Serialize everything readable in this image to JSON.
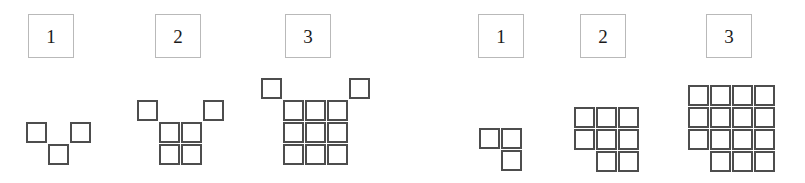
{
  "figure": {
    "title": "",
    "background_color": "#ffffff",
    "square_border_color": "#4d4d4d",
    "label_border_color": "#b9b9b9",
    "label_text_color": "#1a1a1a",
    "canvas": {
      "width": 805,
      "height": 183
    }
  },
  "groups": [
    {
      "id": "left-sequence",
      "figures": [
        {
          "label": "1",
          "label_box": {
            "x": 28,
            "y": 14,
            "w": 46,
            "h": 44
          },
          "square_size": 21,
          "cell": 22,
          "origin": {
            "x": 26,
            "y": 122
          },
          "cells": [
            {
              "col": 0,
              "row": 0
            },
            {
              "col": 2,
              "row": 0
            },
            {
              "col": 1,
              "row": 1
            }
          ],
          "square_count": 3
        },
        {
          "label": "2",
          "label_box": {
            "x": 155,
            "y": 14,
            "w": 46,
            "h": 44
          },
          "square_size": 21,
          "cell": 22,
          "origin": {
            "x": 137,
            "y": 100
          },
          "cells": [
            {
              "col": 0,
              "row": 0
            },
            {
              "col": 3,
              "row": 0
            },
            {
              "col": 1,
              "row": 1
            },
            {
              "col": 2,
              "row": 1
            },
            {
              "col": 1,
              "row": 2
            },
            {
              "col": 2,
              "row": 2
            }
          ],
          "square_count": 6
        },
        {
          "label": "3",
          "label_box": {
            "x": 285,
            "y": 14,
            "w": 46,
            "h": 44
          },
          "square_size": 21,
          "cell": 22,
          "origin": {
            "x": 261,
            "y": 78
          },
          "cells": [
            {
              "col": 0,
              "row": 0
            },
            {
              "col": 4,
              "row": 0
            },
            {
              "col": 1,
              "row": 1
            },
            {
              "col": 2,
              "row": 1
            },
            {
              "col": 3,
              "row": 1
            },
            {
              "col": 1,
              "row": 2
            },
            {
              "col": 2,
              "row": 2
            },
            {
              "col": 3,
              "row": 2
            },
            {
              "col": 1,
              "row": 3
            },
            {
              "col": 2,
              "row": 3
            },
            {
              "col": 3,
              "row": 3
            }
          ],
          "square_count": 11
        }
      ]
    },
    {
      "id": "right-sequence",
      "figures": [
        {
          "label": "1",
          "label_box": {
            "x": 478,
            "y": 14,
            "w": 46,
            "h": 44
          },
          "square_size": 21,
          "cell": 22,
          "origin": {
            "x": 479,
            "y": 128
          },
          "cells": [
            {
              "col": 0,
              "row": 0
            },
            {
              "col": 1,
              "row": 0
            },
            {
              "col": 1,
              "row": 1
            }
          ],
          "square_count": 3
        },
        {
          "label": "2",
          "label_box": {
            "x": 580,
            "y": 14,
            "w": 46,
            "h": 44
          },
          "square_size": 21,
          "cell": 22,
          "origin": {
            "x": 574,
            "y": 107
          },
          "cells": [
            {
              "col": 0,
              "row": 0
            },
            {
              "col": 1,
              "row": 0
            },
            {
              "col": 2,
              "row": 0
            },
            {
              "col": 0,
              "row": 1
            },
            {
              "col": 1,
              "row": 1
            },
            {
              "col": 2,
              "row": 1
            },
            {
              "col": 1,
              "row": 2
            },
            {
              "col": 2,
              "row": 2
            }
          ],
          "square_count": 8
        },
        {
          "label": "3",
          "label_box": {
            "x": 706,
            "y": 14,
            "w": 46,
            "h": 44
          },
          "square_size": 21,
          "cell": 22,
          "origin": {
            "x": 688,
            "y": 85
          },
          "cells": [
            {
              "col": 0,
              "row": 0
            },
            {
              "col": 1,
              "row": 0
            },
            {
              "col": 2,
              "row": 0
            },
            {
              "col": 3,
              "row": 0
            },
            {
              "col": 0,
              "row": 1
            },
            {
              "col": 1,
              "row": 1
            },
            {
              "col": 2,
              "row": 1
            },
            {
              "col": 3,
              "row": 1
            },
            {
              "col": 0,
              "row": 2
            },
            {
              "col": 1,
              "row": 2
            },
            {
              "col": 2,
              "row": 2
            },
            {
              "col": 3,
              "row": 2
            },
            {
              "col": 1,
              "row": 3
            },
            {
              "col": 2,
              "row": 3
            },
            {
              "col": 3,
              "row": 3
            }
          ],
          "square_count": 15
        }
      ]
    }
  ]
}
